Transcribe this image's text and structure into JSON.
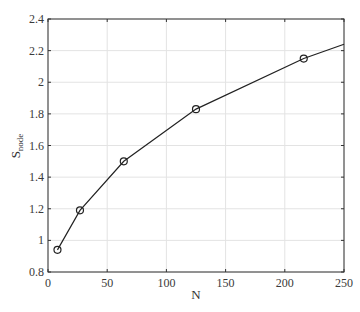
{
  "chart_data": {
    "type": "line",
    "title": "",
    "xlabel": "N",
    "ylabel": "S",
    "ylabel_subscript": "node",
    "xlim": [
      0,
      250
    ],
    "ylim": [
      0.8,
      2.4
    ],
    "grid": true,
    "x_ticks": [
      0,
      50,
      100,
      150,
      200,
      250
    ],
    "y_ticks": [
      0.8,
      1,
      1.2,
      1.4,
      1.6,
      1.8,
      2,
      2.2,
      2.4
    ],
    "x_tick_labels": [
      "0",
      "50",
      "100",
      "150",
      "200",
      "250"
    ],
    "y_tick_labels": [
      "0.8",
      "1",
      "1.2",
      "1.4",
      "1.6",
      "1.8",
      "2",
      "2.2",
      "2.4"
    ],
    "series": [
      {
        "name": "S_node",
        "marker": "circle",
        "color": "#222222",
        "x": [
          8,
          27,
          64,
          125,
          216
        ],
        "values": [
          0.94,
          1.19,
          1.5,
          1.83,
          2.15
        ],
        "line_extension": {
          "x": 250,
          "y": 2.24
        }
      }
    ]
  }
}
